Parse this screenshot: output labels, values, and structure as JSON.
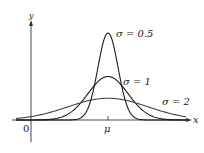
{
  "chart_data": {
    "type": "line",
    "title": "",
    "xlabel": "x",
    "ylabel": "y",
    "x_tick_labels": [
      "0",
      "μ"
    ],
    "grid": false,
    "legend": "inline labels",
    "series": [
      {
        "name": "σ = 0.5",
        "label": "σ = 0.5",
        "sigma": 0.5,
        "peak_relative": 1.0
      },
      {
        "name": "σ = 1",
        "label": "σ = 1",
        "sigma": 1,
        "peak_relative": 0.5
      },
      {
        "name": "σ = 2",
        "label": "σ = 2",
        "sigma": 2,
        "peak_relative": 0.25
      }
    ]
  },
  "axis": {
    "x_label": "x",
    "y_label": "y",
    "origin_label": "0",
    "mu_label": "μ"
  },
  "labels": {
    "s05": "σ = 0.5",
    "s1": "σ = 1",
    "s2": "σ = 2"
  },
  "colors": {
    "curve": "#1a1a1a",
    "curve_wide": "#444444",
    "axis": "#333333"
  }
}
